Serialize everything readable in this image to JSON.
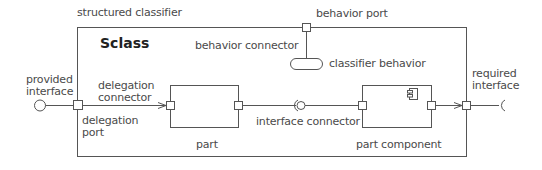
{
  "diagram": {
    "type": "UML composite structure diagram",
    "colors": {
      "line": "#555555",
      "text": "#4a4a4a",
      "title": "#222222",
      "background": "#ffffff"
    },
    "labels": {
      "structured_classifier": "structured classifier",
      "class_name": "Sclass",
      "behavior_port": "behavior port",
      "behavior_connector": "behavior connector",
      "classifier_behavior": "classifier behavior",
      "provided_interface_1": "provided",
      "provided_interface_2": "interface",
      "required_interface_1": "required",
      "required_interface_2": "interface",
      "delegation_connector_1": "delegation",
      "delegation_connector_2": "connector",
      "delegation_port_1": "delegation",
      "delegation_port_2": "port",
      "interface_connector": "interface connector",
      "part": "part",
      "part_component": "part component"
    },
    "icons": [
      "port-square",
      "lollipop-provided-interface",
      "socket-required-interface",
      "ball-and-socket-assembly",
      "component-icon",
      "classifier-behavior-rounded-rect",
      "arrowhead"
    ]
  }
}
